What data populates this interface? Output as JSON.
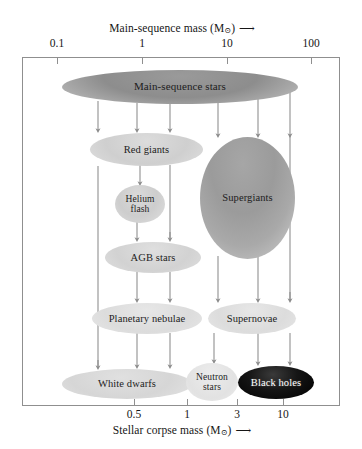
{
  "figure": {
    "top_axis": {
      "caption": "Main-sequence mass (M",
      "caption_sub": "⊙",
      "caption_close": ")",
      "arrow": "⟶",
      "ticks": [
        {
          "label": "0.1",
          "x": 57
        },
        {
          "label": "1",
          "x": 142
        },
        {
          "label": "10",
          "x": 227
        },
        {
          "label": "100",
          "x": 311
        }
      ]
    },
    "bottom_axis": {
      "caption": "Stellar corpse mass (M",
      "caption_sub": "⊙",
      "caption_close": ")",
      "arrow": "⟶",
      "ticks": [
        {
          "label": "0.5",
          "x": 134
        },
        {
          "label": "1",
          "x": 187
        },
        {
          "label": "3",
          "x": 237
        },
        {
          "label": "10",
          "x": 283
        }
      ]
    },
    "nodes": [
      {
        "id": "main-sequence-stars",
        "label": "Main-sequence stars",
        "tone": "dark-grey"
      },
      {
        "id": "red-giants",
        "label": "Red giants",
        "tone": "light-grey"
      },
      {
        "id": "helium-flash",
        "label": "Helium\nflash",
        "tone": "light-grey"
      },
      {
        "id": "supergiants",
        "label": "Supergiants",
        "tone": "mid-grey"
      },
      {
        "id": "agb-stars",
        "label": "AGB stars",
        "tone": "light-grey"
      },
      {
        "id": "planetary-nebulae",
        "label": "Planetary nebulae",
        "tone": "pale-grey"
      },
      {
        "id": "supernovae",
        "label": "Supernovae",
        "tone": "pale-grey"
      },
      {
        "id": "white-dwarfs",
        "label": "White dwarfs",
        "tone": "light-grey"
      },
      {
        "id": "neutron-stars",
        "label": "Neutron\nstars",
        "tone": "pale-grey"
      },
      {
        "id": "black-holes",
        "label": "Black holes",
        "tone": "black"
      }
    ],
    "labels": {
      "main_sequence_stars": "Main-sequence stars",
      "red_giants": "Red giants",
      "helium_flash_line1": "Helium",
      "helium_flash_line2": "flash",
      "supergiants": "Supergiants",
      "agb_stars": "AGB stars",
      "planetary_nebulae": "Planetary nebulae",
      "supernovae": "Supernovae",
      "white_dwarfs": "White dwarfs",
      "neutron_stars_line1": "Neutron",
      "neutron_stars_line2": "stars",
      "black_holes": "Black holes"
    },
    "colors": {
      "frame": "#8f8f8f",
      "arrow": "#8b8b8b",
      "dark_ellipse": "#8d8d8d",
      "mid_ellipse": "#9b9b9b",
      "light_ellipse": "#d4d4d4",
      "pale_ellipse": "#e4e4e4",
      "black_ellipse": "#000000",
      "text": "#1a1a1a",
      "background": "#ffffff"
    },
    "flow_columns": [
      98,
      137,
      170,
      218,
      258,
      290
    ]
  }
}
